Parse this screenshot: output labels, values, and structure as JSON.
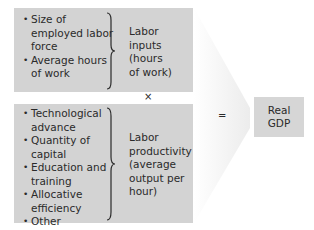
{
  "top_box": {
    "items": [
      "Size of employed labor force",
      "Average hours of work"
    ],
    "label": [
      "Labor",
      "inputs",
      "(hours",
      "of work)"
    ]
  },
  "multiply_symbol": "×",
  "bottom_box": {
    "items": [
      "Technological advance",
      "Quantity of capital",
      "Education and training",
      "Allocative efficiency",
      "Other"
    ],
    "label": [
      "Labor",
      "productivity",
      "(average",
      "output per",
      "hour)"
    ]
  },
  "equals_symbol": "=",
  "result_box": {
    "label": [
      "Real",
      "GDP"
    ]
  },
  "colors": {
    "box_fill": "#d3d3d3",
    "text": "#2a2a2a"
  }
}
